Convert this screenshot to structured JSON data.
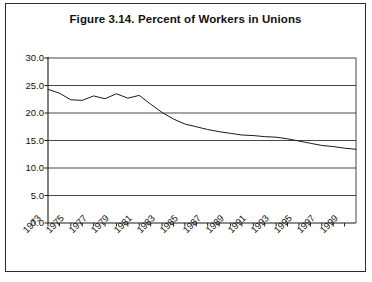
{
  "figure": {
    "title": "Figure 3.14.  Percent of Workers in Unions",
    "border_color": "#2b2b2b",
    "background": "#ffffff"
  },
  "chart_data": {
    "type": "line",
    "title": "Figure 3.14.  Percent of Workers in Unions",
    "xlabel": "",
    "ylabel": "",
    "ylim": [
      0.0,
      30.0
    ],
    "xlim": [
      1973,
      2000
    ],
    "ytick_values": [
      0.0,
      5.0,
      10.0,
      15.0,
      20.0,
      25.0,
      30.0
    ],
    "ytick_labels": [
      "0.0",
      "5.0",
      "10.0",
      "15.0",
      "20.0",
      "25.0",
      "30.0"
    ],
    "xtick_labels": [
      "1973",
      "1975",
      "1977",
      "1979",
      "1981",
      "1983",
      "1985",
      "1987",
      "1989",
      "1991",
      "1993",
      "1995",
      "1997",
      "1999"
    ],
    "xtick_years": [
      1973,
      1975,
      1977,
      1979,
      1981,
      1983,
      1985,
      1987,
      1989,
      1991,
      1993,
      1995,
      1997,
      1999
    ],
    "minor_tick_years": [
      1974,
      1976,
      1978,
      1980,
      1982,
      1984,
      1986,
      1988,
      1990,
      1992,
      1994,
      1996,
      1998
    ],
    "grid": "horizontal",
    "legend": "none",
    "line_color": "#1a1a1a",
    "line_width": 1.0,
    "series": [
      {
        "name": "Percent of Workers in Unions",
        "x": [
          1973,
          1974,
          1975,
          1976,
          1977,
          1978,
          1979,
          1980,
          1981,
          1982,
          1983,
          1984,
          1985,
          1986,
          1987,
          1988,
          1989,
          1990,
          1991,
          1992,
          1993,
          1994,
          1995,
          1996,
          1997,
          1998,
          1999,
          2000
        ],
        "values": [
          24.3,
          23.6,
          22.4,
          22.3,
          23.1,
          22.6,
          23.5,
          22.7,
          23.2,
          21.6,
          20.1,
          18.9,
          18.0,
          17.5,
          17.0,
          16.6,
          16.3,
          16.0,
          15.9,
          15.7,
          15.6,
          15.3,
          14.9,
          14.5,
          14.1,
          13.9,
          13.6,
          13.4
        ]
      }
    ]
  },
  "plot_geometry": {
    "left": 42,
    "right": 350,
    "top": 54,
    "bottom": 219
  }
}
